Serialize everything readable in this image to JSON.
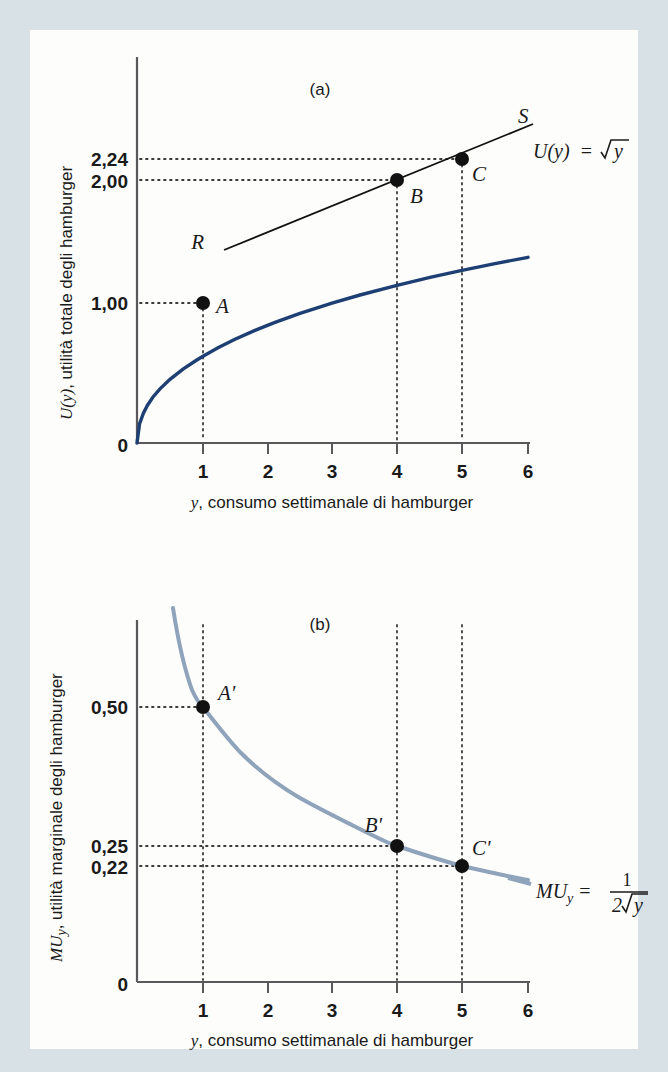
{
  "figure": {
    "panel_a_tag": "(a)",
    "panel_b_tag": "(b)",
    "panel_a": {
      "y_axis_title_italic": "U(y)",
      "y_axis_title_rest": ", utilità totale degli hamburger",
      "x_axis_title_italic": "y",
      "x_axis_title_rest": ", consumo settimanale di hamburger",
      "origin_label": "0",
      "y_tick_labels": [
        "2,24",
        "2,00",
        "1,00"
      ],
      "x_tick_labels": [
        "1",
        "2",
        "3",
        "4",
        "5",
        "6"
      ],
      "point_labels": [
        "A",
        "B",
        "C"
      ],
      "tangent_labels": [
        "R",
        "S"
      ],
      "curve_equation_lhs": "U(y)",
      "curve_equation_eq": "=",
      "curve_equation_rhs_radical": "y"
    },
    "panel_b": {
      "y_axis_title_italic": "MU",
      "y_axis_title_sub": "y",
      "y_axis_title_rest": ", utilità marginale degli hamburger",
      "x_axis_title_italic": "y",
      "x_axis_title_rest": ", consumo settimanale di hamburger",
      "origin_label": "0",
      "y_tick_labels": [
        "0,50",
        "0,25",
        "0,22"
      ],
      "x_tick_labels": [
        "1",
        "2",
        "3",
        "4",
        "5",
        "6"
      ],
      "point_labels": [
        "A'",
        "B'",
        "C'"
      ],
      "curve_equation_lhs": "MU",
      "curve_equation_sub": "y",
      "curve_equation_eq": "=",
      "curve_equation_numerator": "1",
      "curve_equation_denominator_coef": "2",
      "curve_equation_denominator_radical": "y"
    }
  },
  "colors": {
    "page_tint": "#d8e2e6",
    "paper": "#fdfdfc",
    "curve_total_utility": "#1d3f73",
    "curve_marginal_utility": "#8fa3bb",
    "axis": "#59595b",
    "dotted_guide": "#3b3b3b",
    "point_fill": "#111111",
    "tangent_line": "#111111",
    "text": "#1a1a1a"
  },
  "chart_data": [
    {
      "type": "line",
      "id": "panel-a-total-utility",
      "title": "(a)",
      "xlabel": "y, consumo settimanale di hamburger",
      "ylabel": "U(y), utilità totale degli hamburger",
      "xlim": [
        0,
        6
      ],
      "ylim": [
        0,
        2.5
      ],
      "xticks": [
        0,
        1,
        2,
        3,
        4,
        5,
        6
      ],
      "yticks": [
        1.0,
        2.0,
        2.24
      ],
      "ytick_labels": [
        "1,00",
        "2,00",
        "2,24"
      ],
      "grid": false,
      "function": "U(y) = sqrt(y)",
      "series": [
        {
          "name": "U(y) = √y",
          "color": "#1d3f73",
          "x": [
            0,
            0.1,
            0.25,
            0.5,
            0.75,
            1,
            1.5,
            2,
            2.5,
            3,
            3.5,
            4,
            4.5,
            5,
            5.5,
            6
          ],
          "y": [
            0,
            0.32,
            0.5,
            0.71,
            0.87,
            1.0,
            1.22,
            1.41,
            1.58,
            1.73,
            1.87,
            2.0,
            2.12,
            2.24,
            2.35,
            2.45
          ]
        },
        {
          "name": "tangent R-S (touches curve near B and C)",
          "color": "#111111",
          "x": [
            2.2,
            6.0
          ],
          "y": [
            1.55,
            2.47
          ],
          "endpoint_labels": [
            "R",
            "S"
          ]
        }
      ],
      "annotations": [
        {
          "label": "A",
          "x": 1,
          "y": 1.0,
          "guides": "dotted to both axes"
        },
        {
          "label": "B",
          "x": 4,
          "y": 2.0,
          "guides": "dotted to both axes"
        },
        {
          "label": "C",
          "x": 5,
          "y": 2.24,
          "guides": "dotted to both axes"
        }
      ]
    },
    {
      "type": "line",
      "id": "panel-b-marginal-utility",
      "title": "(b)",
      "xlabel": "y, consumo settimanale di hamburger",
      "ylabel": "MUy, utilità marginale degli hamburger",
      "xlim": [
        0,
        6
      ],
      "ylim": [
        0,
        0.65
      ],
      "xticks": [
        0,
        1,
        2,
        3,
        4,
        5,
        6
      ],
      "yticks": [
        0.22,
        0.25,
        0.5
      ],
      "ytick_labels": [
        "0,22",
        "0,25",
        "0,50"
      ],
      "grid": false,
      "function": "MU_y = 1 / (2*sqrt(y))",
      "series": [
        {
          "name": "MUy = 1/(2√y)",
          "color": "#8fa3bb",
          "x": [
            0.55,
            0.7,
            1,
            1.5,
            2,
            2.5,
            3,
            3.5,
            4,
            4.5,
            5,
            5.5,
            6
          ],
          "y": [
            0.674,
            0.598,
            0.5,
            0.408,
            0.354,
            0.316,
            0.289,
            0.267,
            0.25,
            0.236,
            0.224,
            0.213,
            0.204
          ]
        }
      ],
      "annotations": [
        {
          "label": "A'",
          "x": 1,
          "y": 0.5,
          "guides": "dotted to both axes"
        },
        {
          "label": "B'",
          "x": 4,
          "y": 0.25,
          "guides": "dotted to both axes"
        },
        {
          "label": "C'",
          "x": 5,
          "y": 0.22,
          "guides": "dotted to both axes"
        }
      ]
    }
  ]
}
